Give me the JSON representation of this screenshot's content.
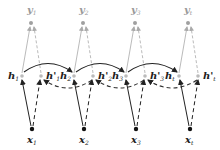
{
  "diagram": {
    "type": "bidirectional-rnn",
    "colors": {
      "forward": "#222222",
      "backward": "#333333",
      "output": "#9a9a9a",
      "output_node": "#a0a0a0"
    },
    "columns": [
      {
        "y": "y",
        "y_sub": "1",
        "h": "h",
        "h_sub": "1",
        "hb": "h'",
        "hb_sub": "1",
        "x": "x",
        "x_sub": "1"
      },
      {
        "y": "y",
        "y_sub": "2",
        "h": "h",
        "h_sub": "2",
        "hb": "h'",
        "hb_sub": "2",
        "x": "x",
        "x_sub": "2"
      },
      {
        "y": "y",
        "y_sub": "3",
        "h": "h",
        "h_sub": "3",
        "hb": "h'",
        "hb_sub": "3",
        "x": "x",
        "x_sub": "3"
      },
      {
        "y": "y",
        "y_sub": "t",
        "h": "h",
        "h_sub": "t",
        "hb": "h'",
        "hb_sub": "t",
        "x": "x",
        "x_sub": "t"
      }
    ],
    "edges": {
      "forward": "solid curved arrows h_i -> h_{i+1}",
      "backward": "dashed curved arrows h'_{i+1} -> h'_i",
      "input_forward": "solid x_i -> h_i",
      "input_backward": "dashed x_i -> h'_i",
      "output_forward": "solid gray h_i -> y_i",
      "output_backward": "dashed gray h'_i -> y_i"
    }
  }
}
